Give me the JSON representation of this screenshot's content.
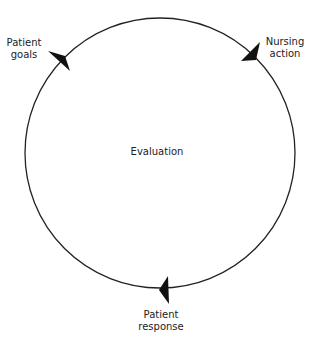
{
  "diagram": {
    "center_label": "Evaluation",
    "nodes": [
      {
        "id": "patient-goals",
        "line1": "Patient",
        "line2": "goals"
      },
      {
        "id": "nursing-action",
        "line1": "Nursing",
        "line2": "action"
      },
      {
        "id": "patient-response",
        "line1": "Patient",
        "line2": "response"
      }
    ],
    "cycle_direction": "clockwise",
    "colors": {
      "line": "#222222",
      "arrow": "#111111",
      "background": "#ffffff"
    }
  }
}
